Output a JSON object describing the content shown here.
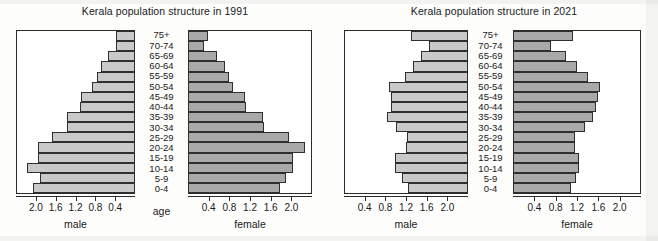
{
  "colors": {
    "male_bar": "#c9c9c9",
    "female_bar": "#a9a9a9",
    "bar_border": "#2f2f2f",
    "axis": "#2b2b2b",
    "text": "#1a1a1a",
    "background": "#fdfdfc"
  },
  "age_groups": [
    "0-4",
    "5-9",
    "10-14",
    "15-19",
    "20-24",
    "25-29",
    "30-34",
    "35-39",
    "40-44",
    "45-49",
    "50-54",
    "55-59",
    "60-64",
    "65-69",
    "70-74",
    "75+"
  ],
  "age_axis_label": "age",
  "tick_values": [
    0.4,
    0.8,
    1.2,
    1.6,
    2.0
  ],
  "tick_labels": [
    "0.4",
    "0.8",
    "1.2",
    "1.6",
    "2.0"
  ],
  "axis_max": 2.4,
  "charts": [
    {
      "id": "1991",
      "title": "Kerala population structure in 1991",
      "male_label": "male",
      "female_label": "female",
      "show_age_axis_label": true,
      "male_axis_reversed": true,
      "female_axis_reversed": false
    },
    {
      "id": "2021",
      "title": "Kerala population structure in 2021",
      "male_label": "male",
      "female_label": "female",
      "show_age_axis_label": false,
      "male_axis_reversed": false,
      "female_axis_reversed": false
    }
  ],
  "chart_data": [
    {
      "type": "bar",
      "subtype": "population-pyramid",
      "title": "Kerala population structure in 1991",
      "xlabel": "population (millions)",
      "ylabel": "age",
      "categories": [
        "0-4",
        "5-9",
        "10-14",
        "15-19",
        "20-24",
        "25-29",
        "30-34",
        "35-39",
        "40-44",
        "45-49",
        "50-54",
        "55-59",
        "60-64",
        "65-69",
        "70-74",
        "75+"
      ],
      "series": [
        {
          "name": "male",
          "direction": "left",
          "values": [
            2.1,
            1.95,
            2.22,
            1.98,
            2.0,
            1.7,
            1.4,
            1.4,
            1.12,
            1.1,
            0.88,
            0.78,
            0.7,
            0.56,
            0.38,
            0.4
          ]
        },
        {
          "name": "female",
          "direction": "right",
          "values": [
            1.8,
            1.92,
            2.06,
            2.06,
            2.3,
            1.98,
            1.5,
            1.48,
            1.15,
            1.12,
            0.88,
            0.8,
            0.72,
            0.58,
            0.32,
            0.4
          ]
        }
      ],
      "xlim": [
        0,
        2.4
      ],
      "xticks": [
        0.4,
        0.8,
        1.2,
        1.6,
        2.0
      ],
      "grid": false,
      "legend": "none"
    },
    {
      "type": "bar",
      "subtype": "population-pyramid",
      "title": "Kerala population structure in 2021",
      "xlabel": "population (millions)",
      "ylabel": "age",
      "categories": [
        "0-4",
        "5-9",
        "10-14",
        "15-19",
        "20-24",
        "25-29",
        "30-34",
        "35-39",
        "40-44",
        "45-49",
        "50-54",
        "55-59",
        "60-64",
        "65-69",
        "70-74",
        "75+"
      ],
      "series": [
        {
          "name": "male",
          "direction": "left",
          "values": [
            1.18,
            1.3,
            1.44,
            1.44,
            1.22,
            1.2,
            1.42,
            1.6,
            1.52,
            1.52,
            1.56,
            1.24,
            1.08,
            0.92,
            0.76,
            1.12
          ]
        },
        {
          "name": "female",
          "direction": "right",
          "values": [
            1.1,
            1.2,
            1.26,
            1.26,
            1.18,
            1.18,
            1.38,
            1.52,
            1.58,
            1.62,
            1.66,
            1.42,
            1.22,
            1.0,
            0.72,
            1.14
          ]
        }
      ],
      "xlim": [
        0,
        2.4
      ],
      "xticks": [
        0.4,
        0.8,
        1.2,
        1.6,
        2.0
      ],
      "grid": false,
      "legend": "none"
    }
  ]
}
